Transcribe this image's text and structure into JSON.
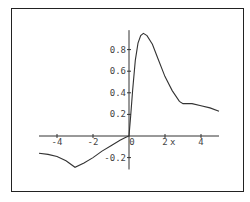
{
  "chart_data": {
    "type": "line",
    "title": "",
    "xlabel": "x",
    "ylabel": "",
    "xlim": [
      -5,
      5
    ],
    "ylim": [
      -0.31,
      0.98
    ],
    "grid": false,
    "legend": null,
    "x_ticks": [
      -4,
      -2,
      0,
      2,
      4
    ],
    "x_tick_labels": [
      "-4",
      "-2",
      "0",
      "2",
      "4"
    ],
    "y_ticks": [
      -0.2,
      0.2,
      0.4,
      0.6,
      0.8
    ],
    "y_tick_labels": [
      "-0.2",
      "0.2",
      "0.4",
      "0.6",
      "0.8"
    ],
    "series": [
      {
        "name": "f(x)",
        "color": "#333333",
        "x": [
          -5,
          -4.5,
          -4,
          -3.5,
          -3,
          -2.5,
          -2,
          -1.5,
          -1,
          -0.5,
          -0.2,
          0,
          0.1,
          0.2,
          0.35,
          0.5,
          0.65,
          0.8,
          1.0,
          1.3,
          1.6,
          2.0,
          2.4,
          2.8,
          3.0,
          3.5,
          4.0,
          4.5,
          5.0
        ],
        "y": [
          -0.16,
          -0.17,
          -0.19,
          -0.23,
          -0.29,
          -0.25,
          -0.2,
          -0.14,
          -0.09,
          -0.04,
          -0.015,
          0,
          0.2,
          0.42,
          0.7,
          0.86,
          0.93,
          0.95,
          0.93,
          0.85,
          0.72,
          0.55,
          0.42,
          0.32,
          0.3,
          0.3,
          0.28,
          0.26,
          0.23
        ]
      }
    ]
  },
  "axes": {
    "x_label": "x",
    "x_tick_labels": [
      "-4",
      "-2",
      "0",
      "2",
      "4"
    ],
    "y_tick_labels": [
      "0.8",
      "0.6",
      "0.4",
      "0.2",
      "-0.2"
    ]
  }
}
